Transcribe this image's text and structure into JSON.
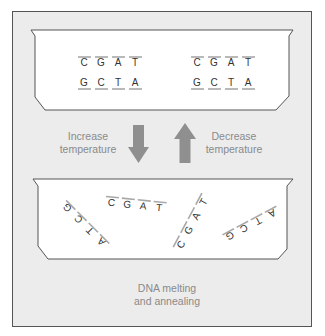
{
  "title": "DNA melting and annealing",
  "caption": {
    "line1": "DNA melting",
    "line2": "and annealing"
  },
  "arrows": {
    "down": {
      "label_line1": "Increase",
      "label_line2": "temperature",
      "direction": "down"
    },
    "up": {
      "label_line1": "Decrease",
      "label_line2": "temperature",
      "direction": "up"
    }
  },
  "annealed_state": {
    "duplexes": [
      {
        "top_strand": [
          "C",
          "G",
          "A",
          "T"
        ],
        "bottom_strand": [
          "G",
          "C",
          "T",
          "A"
        ]
      },
      {
        "top_strand": [
          "C",
          "G",
          "A",
          "T"
        ],
        "bottom_strand": [
          "G",
          "C",
          "T",
          "A"
        ]
      }
    ]
  },
  "melted_state": {
    "single_strands": [
      {
        "bases": [
          "G",
          "C",
          "T",
          "A"
        ]
      },
      {
        "bases": [
          "C",
          "G",
          "A",
          "T"
        ]
      },
      {
        "bases": [
          "C",
          "G",
          "A",
          "T"
        ]
      },
      {
        "bases": [
          "G",
          "C",
          "T",
          "A"
        ]
      }
    ]
  },
  "colors": {
    "frame_fill": "#ececec",
    "frame_stroke": "#555555",
    "tray_fill": "#ffffff",
    "arrow": "#8f8f8f",
    "label_text": "#8a8a8a",
    "base_text": "#333333",
    "backbone": "#a8a8a8"
  }
}
